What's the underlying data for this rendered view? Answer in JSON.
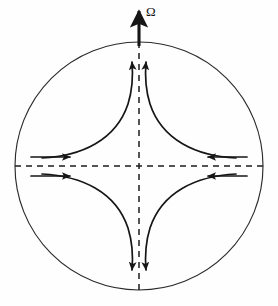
{
  "figure": {
    "kind": "streamline-diagram",
    "background_color": "#fefefe",
    "stroke_color": "#161616",
    "circle_stroke_color": "#2b2b2b",
    "dashed_stroke_color": "#1d1d1d",
    "width": 278,
    "height": 306
  },
  "labels": {
    "rotation_axis": "Ω"
  },
  "geometry": {
    "circle": {
      "cx": 139,
      "cy": 166,
      "r": 124
    },
    "center_point": {
      "x": 139,
      "y": 166
    },
    "axis_arrow": {
      "x": 139,
      "y_tip": 8,
      "y_tail": 44
    },
    "dashed_vertical": {
      "x": 139,
      "y_top": 42,
      "y_bottom": 290
    },
    "dashed_horizontal": {
      "y": 166,
      "x_left": 15,
      "x_right": 263
    }
  },
  "streamlines": {
    "inflow_labels": [
      "left-upper",
      "left-lower",
      "right-upper",
      "right-lower"
    ],
    "outflow_labels": [
      "top-left",
      "top-right",
      "bottom-left",
      "bottom-right"
    ],
    "arrow_count": 8
  },
  "colors": {
    "ink": "#161616",
    "paper": "#fefefe",
    "circle": "#2b2b2b",
    "dash": "#1d1d1d"
  }
}
